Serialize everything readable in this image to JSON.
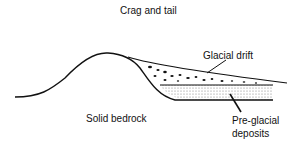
{
  "title": "Crag and tail",
  "labels": {
    "glacial_drift": "Glacial drift",
    "solid_bedrock": "Solid bedrock",
    "pre_glacial_line1": "Pre-glacial",
    "pre_glacial_line2": "deposits"
  }
}
